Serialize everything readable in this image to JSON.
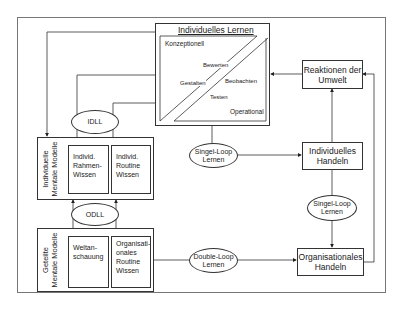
{
  "diagram": {
    "central": {
      "title": "Individuelles Lernen",
      "conceptual_label": "Konzeptionell",
      "operational_label": "Operational",
      "cycle": [
        "Bewerten",
        "Beobachten",
        "Testen",
        "Gestalten"
      ]
    },
    "left": {
      "individual_models": {
        "label": "Individuelle\nMentale Modelle",
        "sub_left": "Individ.\nRahmen-\nWissen",
        "sub_right": "Individ.\nRoutine\nWissen"
      },
      "idll": "IDLL",
      "odll": "ODLL",
      "shared_models": {
        "label": "Geteilte\nMentale Modelle",
        "sub_left": "Weltan-\nschauung",
        "sub_right": "Organisati-\nonales\nRoutine\nWissen"
      }
    },
    "middle": {
      "single_loop": "Singel-Loop\nLernen",
      "double_loop": "Double-Loop\nLernen"
    },
    "right": {
      "reactions": "Reaktionen der\nUmwelt",
      "individual_action": "Individuelles\nHandeln",
      "single_loop": "Singel-Loop\nLernen",
      "org_action": "Organisationales\nHandeln"
    }
  }
}
